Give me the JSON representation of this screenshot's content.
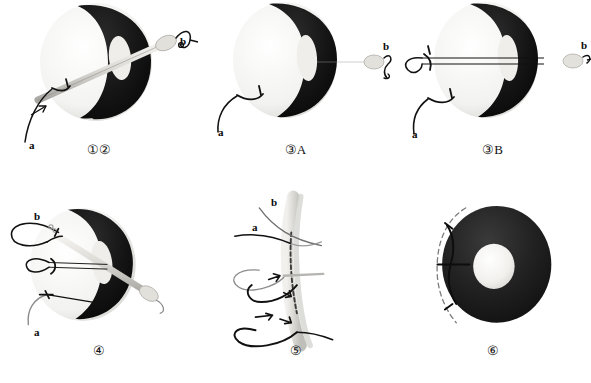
{
  "figure": {
    "background_color": "#ffffff",
    "columns": 3,
    "rows": 2,
    "palette": {
      "tissue_dark": "#151515",
      "tissue_light": "#f2f2f0",
      "instrument": "#d9d7d2",
      "instrument_shadow": "#a8a6a1",
      "suture_dark": "#141414",
      "suture_gray": "#8d8d8d",
      "label_text": "#0a0a0a"
    }
  },
  "panels": [
    {
      "id": "panel-1",
      "caption": "①②",
      "view": "oblique",
      "description": "Oblique view of the sphincter ring with dark posterior segment and pale anterior segment; a needle holder shaft passes through the lumen from lower left to upper right, carrying suture b at the distal tip and suture a exiting at lower left with a directional arrow.",
      "labels": [
        {
          "text": "a",
          "name": "label-a",
          "x": 29,
          "y": 140
        },
        {
          "text": "b",
          "name": "label-b",
          "x": 203,
          "y": 40
        }
      ]
    },
    {
      "id": "panel-2",
      "caption": "③A",
      "view": "frontal",
      "description": "Frontal view of the ring; the straight instrument shaft passes horizontally through the lumen with suture b held at the right-hand tip and suture a curving away to the lower left.",
      "labels": [
        {
          "text": "a",
          "name": "label-a",
          "x": 29,
          "y": 124
        },
        {
          "text": "b",
          "name": "label-b",
          "x": 204,
          "y": 44
        }
      ]
    },
    {
      "id": "panel-3",
      "caption": "③B",
      "view": "frontal-double-strand",
      "description": "Frontal view with two parallel suture strands drawn through the lumen; a loop of thread is formed on the left side of the ring while suture b remains at the right tip and suture a trails to the lower left.",
      "labels": [
        {
          "text": "a",
          "name": "label-a",
          "x": 26,
          "y": 127
        },
        {
          "text": "b",
          "name": "label-b",
          "x": 208,
          "y": 43
        }
      ]
    },
    {
      "id": "panel-4",
      "caption": "④",
      "view": "oblique-three-loops",
      "description": "Oblique view with three suture loops emerging from the left margin of the ring: an upper large loop tagged b, a middle paired-strand loop, and a lower single strand tagged a; the instrument shaft still crosses the lumen to the lower right.",
      "labels": [
        {
          "text": "b",
          "name": "label-b",
          "x": 34,
          "y": 211
        },
        {
          "text": "a",
          "name": "label-a",
          "x": 34,
          "y": 327
        }
      ]
    },
    {
      "id": "panel-5",
      "caption": "⑤",
      "view": "sagittal-section",
      "description": "Sagittal section through the anal canal wall showing the suture tract as a dashed line; strands a and b enter from the upper left, and curved arrows indicate the direction each loop is tightened and thrown around the canal.",
      "labels": [
        {
          "text": "b",
          "name": "label-b",
          "x": 272,
          "y": 198
        },
        {
          "text": "a",
          "name": "label-a",
          "x": 253,
          "y": 222
        }
      ]
    },
    {
      "id": "panel-6",
      "caption": "⑥",
      "view": "final-result",
      "description": "Final result: the ring is uniformly dark with a small pale central lumen; a dashed outline on the left marks the original contour and a bracket shows the amount of tissue taken up by the completed purse-string suture.",
      "labels": []
    }
  ]
}
